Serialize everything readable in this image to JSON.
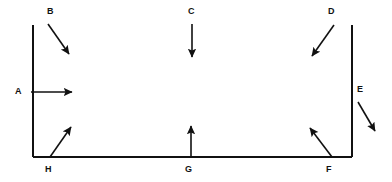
{
  "diagram": {
    "background_color": "#ffffff",
    "stroke_color": "#111111",
    "canvas": {
      "width": 392,
      "height": 182
    },
    "shape": {
      "name": "rectangle",
      "x": 33,
      "y": 25,
      "width": 319,
      "height": 132,
      "stroke_width": 2,
      "fill": "none",
      "note": "top edge fades to light grey toward the right side"
    },
    "labels": [
      {
        "id": "A",
        "text": "A",
        "x": 15,
        "y": 87,
        "position": "left-middle-outside"
      },
      {
        "id": "B",
        "text": "B",
        "x": 47,
        "y": 7,
        "position": "top-left-outside"
      },
      {
        "id": "C",
        "text": "C",
        "x": 188,
        "y": 7,
        "position": "top-center-outside"
      },
      {
        "id": "D",
        "text": "D",
        "x": 328,
        "y": 7,
        "position": "top-right-outside"
      },
      {
        "id": "E",
        "text": "E",
        "x": 357,
        "y": 85,
        "position": "right-middle-outside"
      },
      {
        "id": "F",
        "text": "F",
        "x": 326,
        "y": 165,
        "position": "bottom-right-outside"
      },
      {
        "id": "G",
        "text": "G",
        "x": 185,
        "y": 165,
        "position": "bottom-center-outside"
      },
      {
        "id": "H",
        "text": "H",
        "x": 45,
        "y": 165,
        "position": "bottom-left-outside"
      }
    ],
    "arrows": [
      {
        "id": "A",
        "label": "A",
        "direction": "right",
        "x1": 31,
        "y1": 92,
        "x2": 72,
        "y2": 92
      },
      {
        "id": "B",
        "label": "B",
        "direction": "down-right",
        "x1": 48,
        "y1": 24,
        "x2": 69,
        "y2": 54
      },
      {
        "id": "C",
        "label": "C",
        "direction": "down",
        "x1": 192,
        "y1": 24,
        "x2": 192,
        "y2": 57
      },
      {
        "id": "D",
        "label": "D",
        "direction": "down-left",
        "x1": 334,
        "y1": 25,
        "x2": 312,
        "y2": 56
      },
      {
        "id": "E",
        "label": "E",
        "direction": "down-right",
        "x1": 358,
        "y1": 102,
        "x2": 375,
        "y2": 131
      },
      {
        "id": "F",
        "label": "F",
        "direction": "up-left",
        "x1": 332,
        "y1": 157,
        "x2": 310,
        "y2": 128
      },
      {
        "id": "G",
        "label": "G",
        "direction": "up",
        "x1": 191,
        "y1": 158,
        "x2": 191,
        "y2": 126
      },
      {
        "id": "H",
        "label": "H",
        "direction": "up-right",
        "x1": 50,
        "y1": 157,
        "x2": 71,
        "y2": 127
      }
    ]
  }
}
